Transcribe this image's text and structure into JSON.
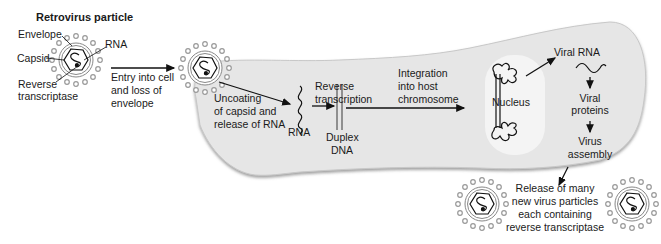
{
  "diagram": {
    "title": "Retrovirus particle",
    "particle_labels": {
      "envelope": "Envelope",
      "capsid": "Capsid",
      "rna": "RNA",
      "reverse_transcriptase_line1": "Reverse",
      "reverse_transcriptase_line2": "transcriptase"
    },
    "steps": {
      "entry": [
        "Entry into cell",
        "and loss of",
        "envelope"
      ],
      "uncoating": [
        "Uncoating",
        "of capsid and",
        "release of RNA"
      ],
      "rna": "RNA",
      "reverse_transcription": [
        "Reverse",
        "transcription"
      ],
      "duplex_dna": [
        "Duplex",
        "DNA"
      ],
      "integration": [
        "Integration",
        "into host",
        "chromosome"
      ],
      "nucleus": "Nucleus",
      "viral_rna": "Viral RNA",
      "viral_proteins": [
        "Viral",
        "proteins"
      ],
      "virus_assembly": [
        "Virus",
        "assembly"
      ],
      "release": [
        "Release of many",
        "new virus particles",
        "each containing",
        "reverse transcriptase"
      ]
    },
    "colors": {
      "cell_fill": "#e6e6e6",
      "cell_shadow": "#9a9a9a",
      "nucleus_fill": "#f4f4f4",
      "spike_color": "#9a9a9a",
      "line_color": "#111111"
    }
  }
}
